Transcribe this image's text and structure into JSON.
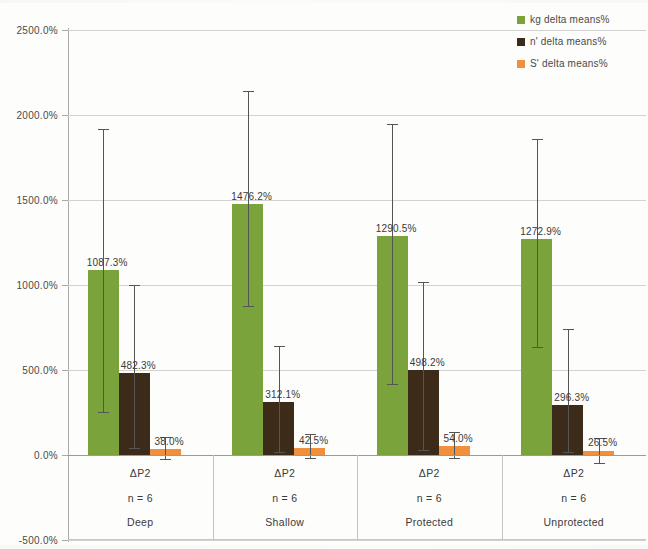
{
  "chart_data": {
    "type": "bar",
    "title": "",
    "subtitle": "",
    "xlabel": "",
    "ylabel": "",
    "grid": true,
    "legend_position": "top-right",
    "ylim": [
      -500,
      2500
    ],
    "ytick_labels": [
      "2500.0%",
      "2000.0%",
      "1500.0%",
      "1000.0%",
      "500.0%",
      "0.0%",
      "-500.0%"
    ],
    "ytick_values": [
      2500,
      2000,
      1500,
      1000,
      500,
      0,
      -500
    ],
    "categories": [
      "Deep",
      "Shallow",
      "Protected",
      "Unprotected"
    ],
    "category_sublabels": [
      "ΔP2",
      "ΔP2",
      "ΔP2",
      "ΔP2"
    ],
    "category_counts": [
      "n = 6",
      "n = 6",
      "n = 6",
      "n = 6"
    ],
    "series": [
      {
        "name": "kg delta means%",
        "color": "#7aa33c",
        "values": [
          1087.3,
          1476.2,
          1290.5,
          1272.9
        ],
        "value_labels": [
          "1087.3%",
          "1476.2%",
          "1290.5%",
          "1272.9%"
        ],
        "error_low": [
          255,
          875,
          420,
          635
        ],
        "error_high": [
          1920,
          2140,
          1950,
          1860
        ]
      },
      {
        "name": "n' delta means%",
        "color": "#3c2b18",
        "values": [
          482.3,
          312.1,
          498.2,
          296.3
        ],
        "value_labels": [
          "482.3%",
          "312.1%",
          "498.2%",
          "296.3%"
        ],
        "error_low": [
          40,
          20,
          30,
          20
        ],
        "error_high": [
          1000,
          640,
          1020,
          740
        ]
      },
      {
        "name": "S' delta means%",
        "color": "#f0903e",
        "values": [
          38.0,
          42.5,
          54.0,
          26.5
        ],
        "value_labels": [
          "38.0%",
          "42.5%",
          "54.0%",
          "26.5%"
        ],
        "error_low": [
          -25,
          -20,
          -15,
          -45
        ],
        "error_high": [
          105,
          125,
          135,
          100
        ]
      }
    ]
  },
  "legend": {
    "items": [
      {
        "label": "kg delta means%",
        "color": "#7aa33c",
        "swatch_name": "legend-swatch-kg"
      },
      {
        "label": "n' delta means%",
        "color": "#3c2b18",
        "swatch_name": "legend-swatch-nprime"
      },
      {
        "label": "S' delta means%",
        "color": "#f0903e",
        "swatch_name": "legend-swatch-sprime"
      }
    ]
  },
  "axis": {
    "y_labels": [
      "2500.0%",
      "2000.0%",
      "1500.0%",
      "1000.0%",
      "500.0%",
      "0.0%",
      "-500.0%"
    ]
  },
  "colors": {
    "kg": "#7aa33c",
    "nprime": "#3c2b18",
    "sprime": "#f0903e",
    "grid": "#d2d2d2",
    "axis": "#a9a9a9",
    "text": "#3a3a3a"
  }
}
